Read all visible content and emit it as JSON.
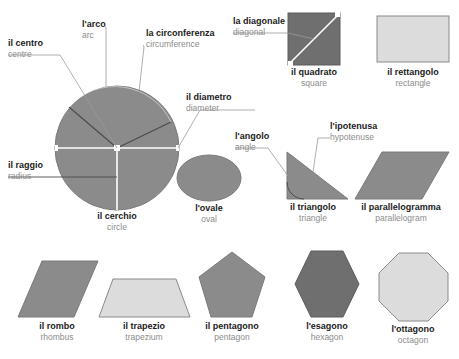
{
  "page": {
    "background": "#ffffff"
  },
  "palette": {
    "shape_dark": "#6f6f6f",
    "shape_mid": "#8b8b8b",
    "shape_light": "#dcdcdc",
    "shape_border": "#7a7a7a",
    "line_white": "#ffffff",
    "line_dark": "#4a4a4a",
    "leader": "#9a9a9a",
    "text_italian": "#1b1b1b",
    "text_english": "#8c8c8c"
  },
  "callouts": {
    "arc": {
      "it": "l'arco",
      "en": "arc"
    },
    "circumference": {
      "it": "la circonferenza",
      "en": "circumference"
    },
    "centre": {
      "it": "il centro",
      "en": "centre"
    },
    "diameter": {
      "it": "il diametro",
      "en": "diameter"
    },
    "radius": {
      "it": "il raggio",
      "en": "radius"
    },
    "diagonal": {
      "it": "la diagonale",
      "en": "diagonal"
    },
    "angle": {
      "it": "l'angolo",
      "en": "angle"
    },
    "hypotenuse": {
      "it": "l'ipotenusa",
      "en": "hypotenuse"
    }
  },
  "shapes": {
    "square": {
      "it": "il quadrato",
      "en": "square",
      "fill": "#6f6f6f"
    },
    "rectangle": {
      "it": "il rettangolo",
      "en": "rectangle",
      "fill": "#dcdcdc"
    },
    "circle": {
      "it": "il cerchio",
      "en": "circle",
      "fill": "#8b8b8b"
    },
    "oval": {
      "it": "l'ovale",
      "en": "oval",
      "fill": "#8b8b8b"
    },
    "triangle": {
      "it": "il triangolo",
      "en": "triangle",
      "fill": "#8b8b8b"
    },
    "parallelogram": {
      "it": "il parallelogramma",
      "en": "parallelogram",
      "fill": "#8b8b8b"
    },
    "rhombus": {
      "it": "il rombo",
      "en": "rhombus",
      "fill": "#8b8b8b"
    },
    "trapezium": {
      "it": "il trapezio",
      "en": "trapezium",
      "fill": "#dcdcdc"
    },
    "pentagon": {
      "it": "il pentagono",
      "en": "pentagon",
      "fill": "#8b8b8b"
    },
    "hexagon": {
      "it": "l'esagono",
      "en": "hexagon",
      "fill": "#6f6f6f"
    },
    "octagon": {
      "it": "l'ottagono",
      "en": "octagon",
      "fill": "#dcdcdc"
    }
  }
}
